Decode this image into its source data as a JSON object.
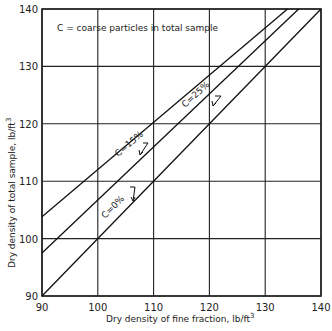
{
  "chart_data": {
    "type": "line",
    "title": "",
    "annotation": "C = coarse particles in total sample",
    "xlabel": "Dry density of fine fraction, lb/ft",
    "xlabel_sup": "3",
    "ylabel": "Dry density of total sample, lb/ft",
    "ylabel_sup": "3",
    "xlim": [
      90,
      140
    ],
    "ylim": [
      90,
      140
    ],
    "xticks": [
      90,
      100,
      110,
      120,
      130,
      140
    ],
    "yticks": [
      90,
      100,
      110,
      120,
      130,
      140
    ],
    "grid": true,
    "series": [
      {
        "name": "C = 0%",
        "label": "C=0%",
        "x": [
          90,
          140
        ],
        "y": [
          90,
          140
        ]
      },
      {
        "name": "C = 15%",
        "label": "C=15%",
        "x": [
          90,
          136
        ],
        "y": [
          97.5,
          140
        ]
      },
      {
        "name": "C = 25%",
        "label": "C=25%",
        "x": [
          90,
          134
        ],
        "y": [
          103.8,
          140
        ]
      }
    ]
  }
}
